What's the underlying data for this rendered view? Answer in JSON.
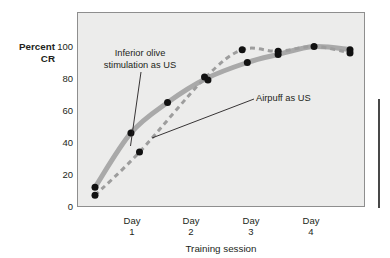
{
  "figure": {
    "background_color": "#ffffff",
    "plot_background_color": "#ececeb",
    "plot_border_color": "#8e8e8e",
    "margin_rule_color": "#1a1a1a"
  },
  "axes": {
    "y_axis_name_line1": "Percent",
    "y_axis_name_line2": "CR",
    "y_ticks": [
      "100",
      "80",
      "60",
      "40",
      "20",
      "0"
    ],
    "y_tick_values": [
      100,
      80,
      60,
      40,
      20,
      0
    ],
    "x_axis_title": "Training session",
    "x_ticks": [
      {
        "line1": "Day",
        "line2": "1"
      },
      {
        "line1": "Day",
        "line2": "2"
      },
      {
        "line1": "Day",
        "line2": "3"
      },
      {
        "line1": "Day",
        "line2": "4"
      }
    ]
  },
  "annotations": [
    {
      "id": "inferior-olive",
      "line1": "Inferior olive",
      "line2": "stimulation as US"
    },
    {
      "id": "airpuff",
      "line1": "Airpuff as US"
    }
  ],
  "chart_data": {
    "type": "line",
    "title": "",
    "xlabel": "Training session",
    "ylabel": "Percent CR",
    "ylim": [
      0,
      100
    ],
    "xlim": [
      0,
      9
    ],
    "grid": false,
    "legend": "annotated inline",
    "x_tick_labels": [
      "Day 1",
      "Day 2",
      "Day 3",
      "Day 4"
    ],
    "x_tick_positions": [
      1.7,
      3.55,
      5.5,
      7.4
    ],
    "series": [
      {
        "name": "Inferior olive stimulation as US",
        "style": "solid",
        "color": "#a9a9a9",
        "line_width_px": 5,
        "values": [
          {
            "x": 1.0,
            "y": 12
          },
          {
            "x": 2.05,
            "y": 46
          },
          {
            "x": 3.12,
            "y": 65
          },
          {
            "x": 4.25,
            "y": 80
          },
          {
            "x": 5.45,
            "y": 90
          },
          {
            "x": 6.35,
            "y": 95
          },
          {
            "x": 7.4,
            "y": 100
          },
          {
            "x": 8.45,
            "y": 98
          }
        ]
      },
      {
        "name": "Airpuff as US",
        "style": "dashed",
        "color": "#9d9d9d",
        "line_width_px": 3,
        "values": [
          {
            "x": 1.0,
            "y": 7
          },
          {
            "x": 2.3,
            "y": 34
          },
          {
            "x": 4.2,
            "y": 80
          },
          {
            "x": 5.3,
            "y": 98
          },
          {
            "x": 6.35,
            "y": 97
          },
          {
            "x": 7.4,
            "y": 100
          },
          {
            "x": 8.45,
            "y": 96
          }
        ]
      }
    ],
    "data_points": [
      {
        "x": 1.0,
        "y": 12,
        "series": "Inferior olive stimulation as US"
      },
      {
        "x": 1.0,
        "y": 7,
        "series": "Airpuff as US"
      },
      {
        "x": 2.05,
        "y": 46,
        "series": "Inferior olive stimulation as US"
      },
      {
        "x": 2.3,
        "y": 34,
        "series": "Airpuff as US"
      },
      {
        "x": 3.12,
        "y": 65,
        "series": "Inferior olive stimulation as US"
      },
      {
        "x": 4.2,
        "y": 81,
        "series": "Airpuff as US"
      },
      {
        "x": 4.3,
        "y": 79,
        "series": "Inferior olive stimulation as US"
      },
      {
        "x": 5.3,
        "y": 98,
        "series": "Airpuff as US"
      },
      {
        "x": 5.45,
        "y": 90,
        "series": "Inferior olive stimulation as US"
      },
      {
        "x": 6.35,
        "y": 97,
        "series": "Airpuff as US"
      },
      {
        "x": 6.35,
        "y": 95,
        "series": "Inferior olive stimulation as US"
      },
      {
        "x": 7.4,
        "y": 100,
        "series": "both"
      },
      {
        "x": 8.45,
        "y": 98,
        "series": "Inferior olive stimulation as US"
      },
      {
        "x": 8.45,
        "y": 96,
        "series": "Airpuff as US"
      }
    ]
  }
}
